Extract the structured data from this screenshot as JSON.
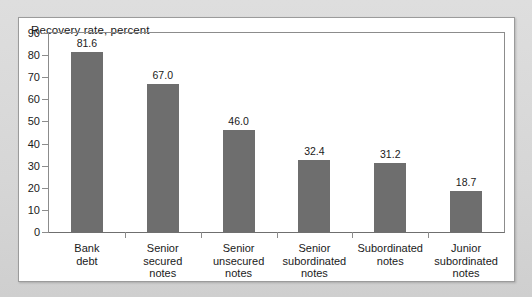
{
  "chart_data": {
    "type": "bar",
    "title": "Recovery rate, percent",
    "xlabel": "",
    "ylabel": "",
    "ylim": [
      0,
      90
    ],
    "ytick_step": 10,
    "yticks": [
      90,
      80,
      70,
      60,
      50,
      40,
      30,
      20,
      10,
      0
    ],
    "grid": false,
    "legend": "none",
    "bar_color": "#6e6e6e",
    "categories": [
      "Bank\ndebt",
      "Senior\nsecured\nnotes",
      "Senior\nunsecured\nnotes",
      "Senior\nsubordinated\nnotes",
      "Subordinated\nnotes",
      "Junior\nsubordinated\nnotes"
    ],
    "values": [
      81.6,
      67.0,
      46.0,
      32.4,
      31.2,
      18.7
    ],
    "value_labels": [
      "81.6",
      "67.0",
      "46.0",
      "32.4",
      "31.2",
      "18.7"
    ]
  },
  "axis": {
    "y_labels": [
      "90",
      "80",
      "70",
      "60",
      "50",
      "40",
      "30",
      "20",
      "10",
      "0"
    ],
    "categories": [
      {
        "lines": [
          "Bank",
          "debt"
        ]
      },
      {
        "lines": [
          "Senior",
          "secured",
          "notes"
        ]
      },
      {
        "lines": [
          "Senior",
          "unsecured",
          "notes"
        ]
      },
      {
        "lines": [
          "Senior",
          "subordinated",
          "notes"
        ]
      },
      {
        "lines": [
          "Subordinated",
          "notes"
        ]
      },
      {
        "lines": [
          "Junior",
          "subordinated",
          "notes"
        ]
      }
    ]
  },
  "colors": {
    "bar": "#6e6e6e",
    "axis": "#8c8c8c",
    "panel_background": "#ffffff",
    "page_background": "#d9d9d9",
    "text": "#1a1a1a"
  }
}
